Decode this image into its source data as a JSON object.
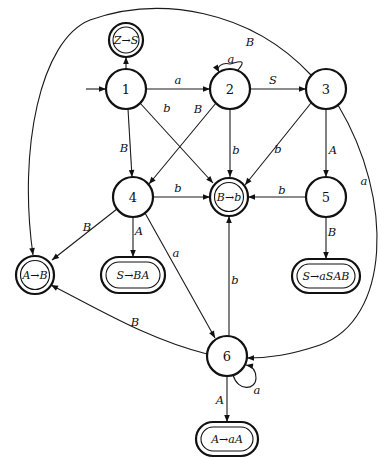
{
  "diagram": {
    "type": "LR(0) automaton / state transition diagram",
    "start_state": "1",
    "states": [
      {
        "id": "1",
        "label": "1",
        "x": 126,
        "y": 89,
        "final": false
      },
      {
        "id": "2",
        "label": "2",
        "x": 230,
        "y": 89,
        "final": false
      },
      {
        "id": "3",
        "label": "3",
        "x": 326,
        "y": 89,
        "final": false
      },
      {
        "id": "4",
        "label": "4",
        "x": 133,
        "y": 197,
        "final": false
      },
      {
        "id": "5",
        "label": "5",
        "x": 326,
        "y": 197,
        "final": false
      },
      {
        "id": "6",
        "label": "6",
        "x": 227,
        "y": 356,
        "final": false
      }
    ],
    "final_states": [
      {
        "id": "ZS",
        "label": "Z→S",
        "x": 126,
        "y": 40,
        "shape": "circle"
      },
      {
        "id": "Bb",
        "label": "B→b",
        "x": 229,
        "y": 197,
        "shape": "circle"
      },
      {
        "id": "AB",
        "label": "A→B",
        "x": 33,
        "y": 275,
        "shape": "circle"
      },
      {
        "id": "SBA",
        "label": "S→BA",
        "x": 133,
        "y": 275,
        "shape": "oval"
      },
      {
        "id": "SaSAB",
        "label": "S→aSAB",
        "x": 326,
        "y": 275,
        "shape": "oval"
      },
      {
        "id": "AaA",
        "label": "A→aA",
        "x": 227,
        "y": 438,
        "shape": "oval"
      }
    ],
    "transitions": [
      {
        "from": "1",
        "to": "ZS",
        "label": "S"
      },
      {
        "from": "1",
        "to": "2",
        "label": "a"
      },
      {
        "from": "1",
        "to": "Bb",
        "label": "b"
      },
      {
        "from": "1",
        "to": "4",
        "label": "B"
      },
      {
        "from": "2",
        "to": "2",
        "label": "a"
      },
      {
        "from": "2",
        "to": "3",
        "label": "S"
      },
      {
        "from": "2",
        "to": "4",
        "label": "B"
      },
      {
        "from": "2",
        "to": "Bb",
        "label": "b"
      },
      {
        "from": "3",
        "to": "AB",
        "label": "B"
      },
      {
        "from": "3",
        "to": "Bb",
        "label": "b"
      },
      {
        "from": "3",
        "to": "5",
        "label": "A"
      },
      {
        "from": "3",
        "to": "6",
        "label": "a"
      },
      {
        "from": "4",
        "to": "Bb",
        "label": "b"
      },
      {
        "from": "4",
        "to": "AB",
        "label": "B"
      },
      {
        "from": "4",
        "to": "SBA",
        "label": "A"
      },
      {
        "from": "4",
        "to": "6",
        "label": "a"
      },
      {
        "from": "5",
        "to": "Bb",
        "label": "b"
      },
      {
        "from": "5",
        "to": "SaSAB",
        "label": "B"
      },
      {
        "from": "6",
        "to": "Bb",
        "label": "b"
      },
      {
        "from": "6",
        "to": "AB",
        "label": "B"
      },
      {
        "from": "6",
        "to": "6",
        "label": "a"
      },
      {
        "from": "6",
        "to": "AaA",
        "label": "A"
      }
    ],
    "edge_labels": {
      "s1_ZS": "S",
      "s1_2": "a",
      "s1_Bb": "b",
      "s1_4": "B",
      "s2_loop": "a",
      "s2_3": "S",
      "s2_4": "B",
      "s2_Bb": "b",
      "s3_AB": "B",
      "s3_Bb": "b",
      "s3_5": "A",
      "s3_6": "a",
      "s4_Bb": "b",
      "s4_AB": "B",
      "s4_SBA": "A",
      "s4_6": "a",
      "s5_Bb": "b",
      "s5_SaSAB": "B",
      "s6_Bb": "b",
      "s6_AB": "B",
      "s6_loop": "a",
      "s6_AaA": "A"
    },
    "state_labels": {
      "n1": "1",
      "n2": "2",
      "n3": "3",
      "n4": "4",
      "n5": "5",
      "n6": "6"
    },
    "production_labels": {
      "ZS": "Z→S",
      "Bb": "B→b",
      "AB": "A→B",
      "SBA": "S→BA",
      "SaSAB": "S→aSAB",
      "AaA": "A→aA"
    }
  }
}
